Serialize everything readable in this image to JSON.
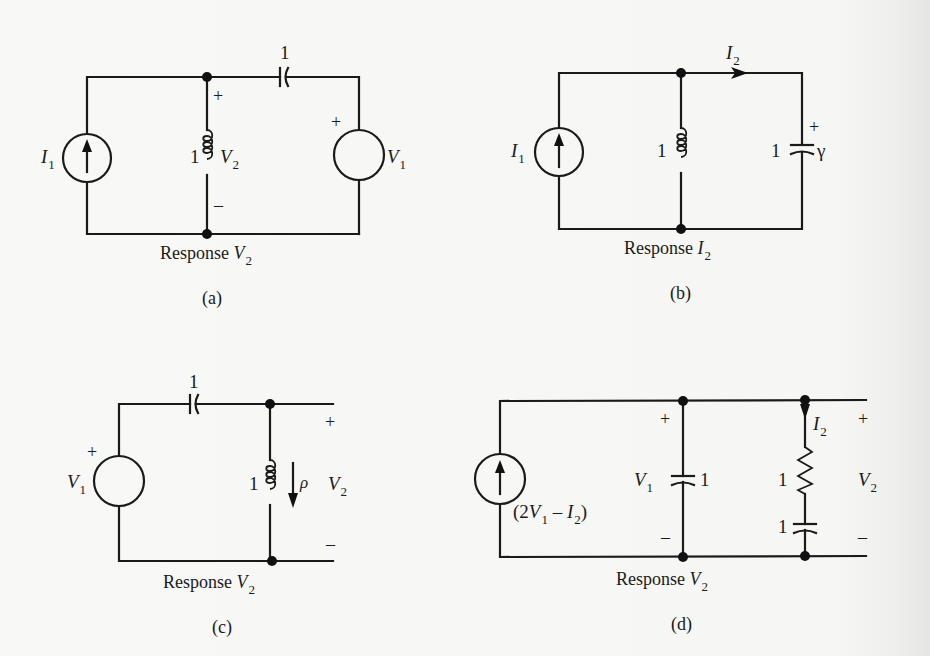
{
  "figure": {
    "panels": [
      {
        "id": "a",
        "caption": "(a)",
        "response_label": "Response",
        "response_var": "V",
        "response_sub": "2",
        "source_left": {
          "type": "current-source",
          "var": "I",
          "sub": "1",
          "direction": "up"
        },
        "series_capacitor": {
          "value": "1"
        },
        "shunt_inductor": {
          "value": "1",
          "voltage_var": "V",
          "voltage_sub": "2",
          "plus": "+",
          "minus": "–"
        },
        "source_right": {
          "type": "voltage-source",
          "var": "V",
          "sub": "1",
          "plus": "+"
        }
      },
      {
        "id": "b",
        "caption": "(b)",
        "response_label": "Response",
        "response_var": "I",
        "response_sub": "2",
        "source_left": {
          "type": "current-source",
          "var": "I",
          "sub": "1",
          "direction": "up"
        },
        "current_arrow": {
          "var": "I",
          "sub": "2"
        },
        "shunt_inductor": {
          "value": "1"
        },
        "shunt_capacitor": {
          "value": "1",
          "plus": "+",
          "voltage_var": "γ"
        }
      },
      {
        "id": "c",
        "caption": "(c)",
        "response_label": "Response",
        "response_var": "V",
        "response_sub": "2",
        "source_left": {
          "type": "voltage-source",
          "var": "V",
          "sub": "1",
          "plus": "+"
        },
        "series_capacitor": {
          "value": "1"
        },
        "shunt_inductor": {
          "value": "1",
          "current_var": "ρ"
        },
        "output": {
          "var": "V",
          "sub": "2",
          "plus": "+",
          "minus": "–"
        }
      },
      {
        "id": "d",
        "caption": "(d)",
        "response_label": "Response",
        "response_var": "V",
        "response_sub": "2",
        "source_left": {
          "type": "dependent-current-source",
          "expr_open": "(2",
          "expr_v": "V",
          "expr_vsub": "1",
          "expr_minus": " – ",
          "expr_i": "I",
          "expr_isub": "2",
          "expr_close": ")"
        },
        "shunt_capacitor": {
          "value": "1",
          "voltage_var": "V",
          "voltage_sub": "1",
          "plus": "+",
          "minus": "–"
        },
        "rc_branch": {
          "current_var": "I",
          "current_sub": "2",
          "resistor_value": "1",
          "capacitor_value": "1"
        },
        "output": {
          "var": "V",
          "sub": "2",
          "plus": "+",
          "minus": "–"
        }
      }
    ]
  }
}
